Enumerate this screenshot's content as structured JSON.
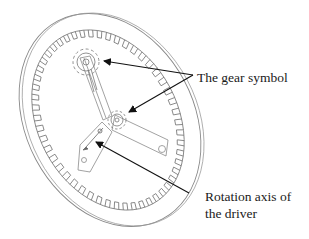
{
  "figure": {
    "type": "mechanical-illustration"
  },
  "labels": {
    "gear_symbol": "The gear symbol",
    "rotation_axis_line1": "Rotation axis of",
    "rotation_axis_line2": "the driver"
  },
  "colors": {
    "background": "#ffffff",
    "line": "#7a7a7a",
    "arrow": "#111111",
    "text": "#1a1a1a"
  },
  "annotations": [
    {
      "label": "The gear symbol",
      "targets": [
        "upper-pinion",
        "center-pinion"
      ]
    },
    {
      "label": "Rotation axis of the driver",
      "targets": [
        "driver-axis"
      ]
    }
  ]
}
